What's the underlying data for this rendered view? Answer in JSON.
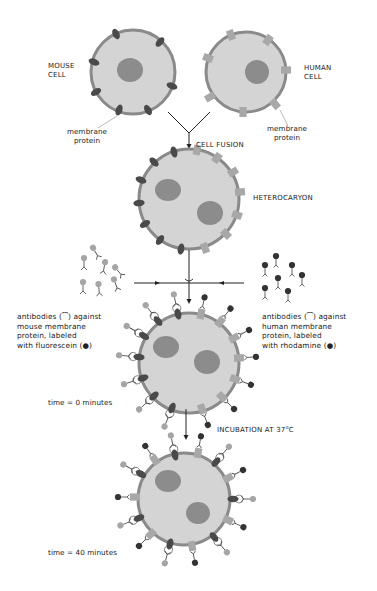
{
  "figure": {
    "colors": {
      "cytoplasm": "#d4d4d4",
      "membrane": "#8a8a8a",
      "nucleus": "#8c8c8c",
      "mouse_protein": "#4a4a4a",
      "human_protein": "#a8a8a8",
      "fluorescein": "#a5a5a5",
      "rhodamine": "#333333",
      "text": "#222222"
    }
  },
  "labels": {
    "mouse_cell": [
      "MOUSE",
      "CELL"
    ],
    "human_cell": [
      "HUMAN",
      "CELL"
    ],
    "mouse_membrane_protein": [
      "membrane",
      "protein"
    ],
    "human_membrane_protein": [
      "membrane",
      "protein"
    ],
    "cell_fusion": "CELL FUSION",
    "heterocaryon": "HETEROCARYON",
    "antibodies_mouse": [
      "antibodies (⁀) against",
      "mouse membrane",
      "protein, labeled",
      "with fluorescein (●)"
    ],
    "antibodies_human": [
      "antibodies (⁀) against",
      "human membrane",
      "protein, labeled",
      "with rhodamine (●)"
    ],
    "time_0": "time = 0 minutes",
    "incubation": "INCUBATION AT 37",
    "incubation_unit_sup": "o",
    "incubation_unit": "C",
    "time_40": "time = 40 minutes"
  },
  "stages": [
    {
      "name": "mouse-cell",
      "cx": 133,
      "cy": 72,
      "r": 43
    },
    {
      "name": "human-cell",
      "cx": 246,
      "cy": 72,
      "r": 41
    },
    {
      "name": "heterocaryon",
      "cx": 189,
      "cy": 199,
      "r": 51
    },
    {
      "name": "labeled-heterocaryon-t0",
      "cx": 189,
      "cy": 363,
      "r": 51
    },
    {
      "name": "labeled-heterocaryon-t40",
      "cx": 184,
      "cy": 499,
      "r": 47
    }
  ]
}
